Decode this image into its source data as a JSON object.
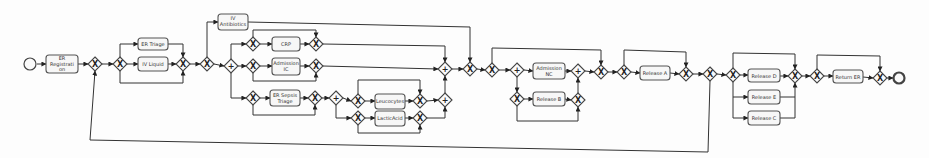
{
  "diagram": {
    "type": "BPMN process model",
    "start_event": {
      "label": ""
    },
    "end_event": {
      "label": ""
    },
    "tasks": [
      {
        "id": "t_reg",
        "label_lines": [
          "ER",
          "Registrati",
          "on"
        ]
      },
      {
        "id": "t_triage",
        "label_lines": [
          "ER Triage"
        ]
      },
      {
        "id": "t_ivliquid",
        "label_lines": [
          "IV Liquid"
        ]
      },
      {
        "id": "t_ivanti",
        "label_lines": [
          "IV",
          "Antibiotics"
        ]
      },
      {
        "id": "t_crp",
        "label_lines": [
          "CRP"
        ]
      },
      {
        "id": "t_admic",
        "label_lines": [
          "Admission",
          "IC"
        ]
      },
      {
        "id": "t_sepsis",
        "label_lines": [
          "ER Sepsis",
          "Triage"
        ]
      },
      {
        "id": "t_leuco",
        "label_lines": [
          "Leucocytes"
        ]
      },
      {
        "id": "t_lactic",
        "label_lines": [
          "LacticAcid"
        ]
      },
      {
        "id": "t_admnc",
        "label_lines": [
          "Admission",
          "NC"
        ]
      },
      {
        "id": "t_relB",
        "label_lines": [
          "Release B"
        ]
      },
      {
        "id": "t_relA",
        "label_lines": [
          "Release A"
        ]
      },
      {
        "id": "t_relD",
        "label_lines": [
          "Release D"
        ]
      },
      {
        "id": "t_relE",
        "label_lines": [
          "Release E"
        ]
      },
      {
        "id": "t_relC",
        "label_lines": [
          "Release C"
        ]
      },
      {
        "id": "t_retER",
        "label_lines": [
          "Return ER"
        ]
      }
    ],
    "gateway_symbols": {
      "xor": "X",
      "and": "+"
    },
    "gateways": {
      "exclusive_count": 27,
      "parallel_count": 7
    },
    "loops": [
      {
        "from": "gateway after Release A",
        "to": "gateway after ER Registration",
        "label": ""
      }
    ]
  },
  "t": {
    "reg": {
      "l1": "ER",
      "l2": "Registrati",
      "l3": "on"
    },
    "triage": "ER Triage",
    "ivliquid": "IV Liquid",
    "ivanti": {
      "l1": "IV",
      "l2": "Antibiotics"
    },
    "crp": "CRP",
    "admic": {
      "l1": "Admission",
      "l2": "IC"
    },
    "sepsis": {
      "l1": "ER Sepsis",
      "l2": "Triage"
    },
    "leuco": "Leucocytes",
    "lactic": "LacticAcid",
    "admnc": {
      "l1": "Admission",
      "l2": "NC"
    },
    "relB": "Release B",
    "relA": "Release A",
    "relD": "Release D",
    "relE": "Release E",
    "relC": "Release C",
    "retER": "Return ER"
  },
  "g": {
    "x": "X",
    "p": "+"
  }
}
